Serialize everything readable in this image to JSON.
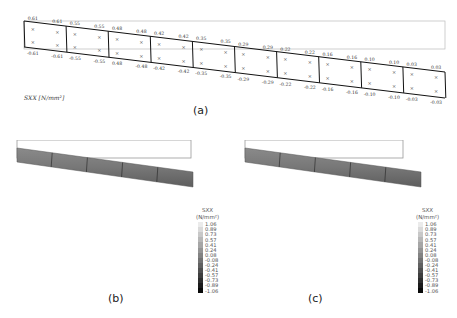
{
  "panel_a": {
    "caption": "(a)",
    "quantity_label": "SXX [N/mm²]",
    "elements": [
      {
        "top": [
          "0.61",
          "0.61"
        ],
        "bottom": [
          "-0.61",
          "-0.61"
        ]
      },
      {
        "top": [
          "0.55",
          "0.55"
        ],
        "bottom": [
          "-0.55",
          "-0.55"
        ]
      },
      {
        "top": [
          "0.48",
          "0.48"
        ],
        "bottom": [
          "0.48",
          "-0.48"
        ]
      },
      {
        "top": [
          "0.42",
          "0.42"
        ],
        "bottom": [
          "-0.42",
          "-0.42"
        ]
      },
      {
        "top": [
          "0.35",
          "0.35"
        ],
        "bottom": [
          "-0.35",
          "-0.35"
        ]
      },
      {
        "top": [
          "0.29",
          "0.29"
        ],
        "bottom": [
          "-0.29",
          "-0.29"
        ]
      },
      {
        "top": [
          "0.22",
          "0.22"
        ],
        "bottom": [
          "-0.22",
          "-0.22"
        ]
      },
      {
        "top": [
          "0.16",
          "0.16"
        ],
        "bottom": [
          "-0.16",
          "-0.16"
        ]
      },
      {
        "top": [
          "0.10",
          "0.10"
        ],
        "bottom": [
          "-0.10",
          "-0.10"
        ]
      },
      {
        "top": [
          "0.03",
          "0.03"
        ],
        "bottom": [
          "-0.03",
          "-0.03"
        ]
      }
    ]
  },
  "panel_b": {
    "caption": "(b)",
    "legend": {
      "title": "SXX",
      "unit": "(N/mm²)",
      "values": [
        "1.06",
        "0.89",
        "0.73",
        "0.57",
        "0.41",
        "0.24",
        "0.08",
        "-0.08",
        "-0.24",
        "-0.41",
        "-0.57",
        "-0.73",
        "-0.89",
        "-1.06"
      ]
    }
  },
  "panel_c": {
    "caption": "(c)",
    "legend": {
      "title": "SXX",
      "unit": "(N/mm²)",
      "values": [
        "1.06",
        "0.89",
        "0.73",
        "0.57",
        "0.41",
        "0.24",
        "0.08",
        "-0.08",
        "-0.24",
        "-0.41",
        "-0.57",
        "-0.73",
        "-0.89",
        "-1.06"
      ]
    }
  }
}
